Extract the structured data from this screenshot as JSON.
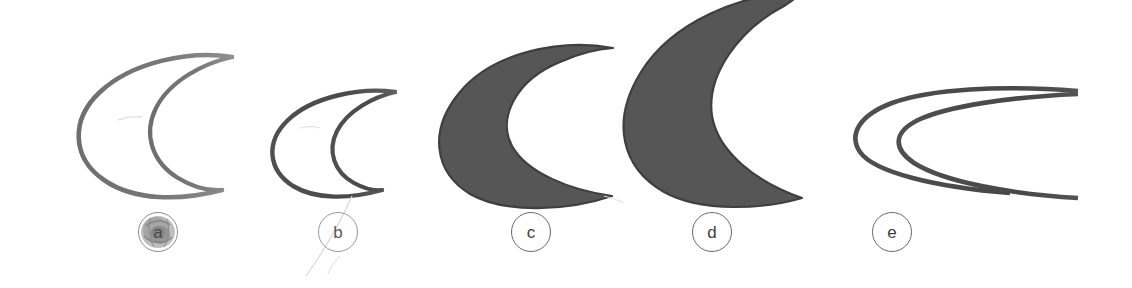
{
  "figure": {
    "kind": "specimen-plate",
    "background_color": "#ffffff",
    "width": 1132,
    "height": 288,
    "caption_style": "circled-lowercase-letter",
    "specimen_count": 5
  },
  "palette": {
    "outline_dark": "#4a4a4a",
    "outline_mid": "#6e6e6e",
    "outline_light": "#8a8a8a",
    "fill_gray": "#565656",
    "fill_gray_edge": "#3f3f3f",
    "label_stroke": "#6b6b6b",
    "label_text": "#3d3d3d",
    "smudge": "#9a9a9a",
    "scuff": "#cfcfcf",
    "background": "#ffffff"
  },
  "specimens": [
    {
      "id": "a",
      "label": "a",
      "label_state": "smudged",
      "render": "outline",
      "stroke_color": "#6e6e6e",
      "size": "medium",
      "description": "lunate crescent outline, open to the right",
      "label_x": 138,
      "label_y": 212
    },
    {
      "id": "b",
      "label": "b",
      "label_state": "faint",
      "render": "outline",
      "stroke_color": "#4a4a4a",
      "size": "small",
      "description": "lunate crescent outline, open to the right",
      "label_x": 318,
      "label_y": 212
    },
    {
      "id": "c",
      "label": "c",
      "label_state": "normal",
      "render": "filled",
      "fill_color": "#565656",
      "size": "large",
      "description": "solid lunate crescent, open to the right",
      "label_x": 511,
      "label_y": 212
    },
    {
      "id": "d",
      "label": "d",
      "label_state": "normal",
      "render": "filled",
      "fill_color": "#565656",
      "size": "x-large",
      "description": "solid broad crescent, open to the right, clipped at top",
      "label_x": 692,
      "label_y": 212
    },
    {
      "id": "e",
      "label": "e",
      "label_state": "normal",
      "render": "outline",
      "stroke_color": "#4a4a4a",
      "size": "elongated",
      "description": "very elongated shallow crescent outline, clipped at right edge",
      "label_x": 872,
      "label_y": 212
    }
  ]
}
